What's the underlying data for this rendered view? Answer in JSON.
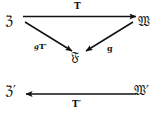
{
  "diagram": {
    "type": "commutative-diagram",
    "background_color": "#ffffff",
    "ink_color": "#111111",
    "nodes": [
      {
        "id": "v",
        "label": "ℨ",
        "role": "top-left-object"
      },
      {
        "id": "w",
        "label": "𝔚",
        "role": "top-right-object"
      },
      {
        "id": "f",
        "label": "𝔉",
        "role": "bottom-center-object"
      },
      {
        "id": "vp",
        "label": "ℨ′",
        "role": "lower-left-object"
      },
      {
        "id": "wp",
        "label": "𝔚′",
        "role": "lower-right-object"
      }
    ],
    "edges": [
      {
        "id": "t",
        "label": "T",
        "from": "v",
        "to": "w",
        "direction": "right"
      },
      {
        "id": "gtp",
        "label": "gT′",
        "from": "v",
        "to": "f",
        "direction": "down-right"
      },
      {
        "id": "g",
        "label": "g",
        "from": "w",
        "to": "f",
        "direction": "down-left"
      },
      {
        "id": "tp",
        "label": "T′",
        "from": "wp",
        "to": "vp",
        "direction": "left"
      }
    ],
    "labels": {
      "top_arrow": "T",
      "left_diagonal_prefix": "g",
      "left_diagonal_main": "T",
      "left_diagonal_prime": "′",
      "right_diagonal": "g",
      "bottom_arrow_main": "T",
      "bottom_arrow_prime": "′"
    }
  }
}
